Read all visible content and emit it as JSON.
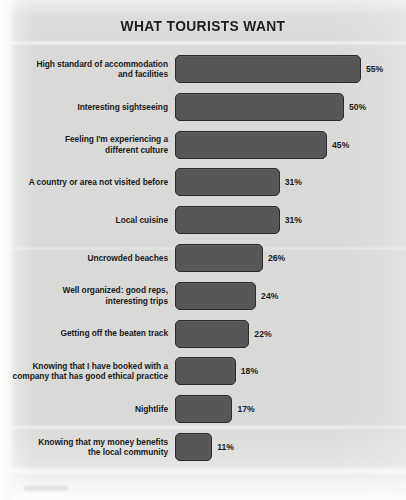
{
  "chart": {
    "title": "WHAT TOURISTS WANT",
    "value_suffix": "%"
  },
  "chart_data": {
    "type": "bar",
    "orientation": "horizontal",
    "title": "WHAT TOURISTS WANT",
    "xlabel": "",
    "ylabel": "",
    "xlim": [
      0,
      60
    ],
    "grid": false,
    "legend": "none",
    "value_format": "{v}%",
    "bar_color": "#575757",
    "bar_outline_color": "#2a2a2a",
    "background_color": "#d9d9d7",
    "text_color": "#1b1b1b",
    "categories": [
      "High standard of accommodation and facilities",
      "Interesting sightseeing",
      "Feeling I'm experiencing a different culture",
      "A country or area not visited before",
      "Local cuisine",
      "Uncrowded beaches",
      "Well organized: good reps, interesting trips",
      "Getting off the beaten track",
      "Knowing that I have booked with a company that has good ethical practice",
      "Nightlife",
      "Knowing that my money benefits the local community"
    ],
    "values": [
      55,
      50,
      45,
      31,
      31,
      26,
      24,
      22,
      18,
      17,
      11
    ],
    "labels": [
      "55%",
      "50%",
      "45%",
      "31%",
      "31%",
      "26%",
      "24%",
      "22%",
      "18%",
      "17%",
      "11%"
    ]
  },
  "rows": [
    {
      "label_lines": [
        "High standard of accommodation",
        "and facilities"
      ],
      "value": 55,
      "value_label": "55%"
    },
    {
      "label_lines": [
        "Interesting sightseeing"
      ],
      "value": 50,
      "value_label": "50%"
    },
    {
      "label_lines": [
        "Feeling I'm experiencing a",
        "different culture"
      ],
      "value": 45,
      "value_label": "45%"
    },
    {
      "label_lines": [
        "A country or area not visited before"
      ],
      "value": 31,
      "value_label": "31%"
    },
    {
      "label_lines": [
        "Local cuisine"
      ],
      "value": 31,
      "value_label": "31%"
    },
    {
      "label_lines": [
        "Uncrowded beaches"
      ],
      "value": 26,
      "value_label": "26%"
    },
    {
      "label_lines": [
        "Well organized: good reps,",
        "interesting trips"
      ],
      "value": 24,
      "value_label": "24%"
    },
    {
      "label_lines": [
        "Getting off the beaten track"
      ],
      "value": 22,
      "value_label": "22%"
    },
    {
      "label_lines": [
        "Knowing that I have booked with a",
        "company that has good ethical practice"
      ],
      "value": 18,
      "value_label": "18%"
    },
    {
      "label_lines": [
        "Nightlife"
      ],
      "value": 17,
      "value_label": "17%"
    },
    {
      "label_lines": [
        "Knowing that my money benefits",
        "the local community"
      ],
      "value": 11,
      "value_label": "11%"
    }
  ]
}
